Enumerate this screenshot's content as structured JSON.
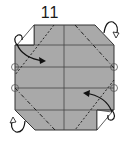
{
  "step": {
    "number": "11"
  },
  "diagram": {
    "paper_color": "#a9a9a9",
    "line_color": "#333333",
    "background": "#ffffff",
    "marks": [
      "valley-fold-lines",
      "mountain-fold-lines",
      "fold-arrows",
      "reference-circles"
    ]
  }
}
